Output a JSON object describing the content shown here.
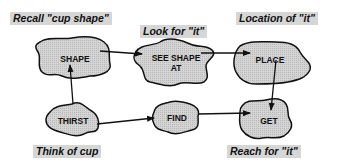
{
  "diagram": {
    "captions": {
      "recall": "Recall \"cup shape\"",
      "look": "Look for \"it\"",
      "location": "Location of \"it\"",
      "think": "Think of cup",
      "reach": "Reach for \"it\""
    },
    "nodes": {
      "shape": "SHAPE",
      "see_shape_line1": "SEE SHAPE",
      "see_shape_line2": "AT",
      "place": "PLACE",
      "thirst": "THIRST",
      "find": "FIND",
      "get": "GET"
    },
    "edges": [
      {
        "from": "THIRST",
        "to": "SHAPE"
      },
      {
        "from": "SHAPE",
        "to": "SEE SHAPE AT"
      },
      {
        "from": "SEE SHAPE AT",
        "to": "PLACE"
      },
      {
        "from": "PLACE",
        "to": "GET"
      },
      {
        "from": "THIRST",
        "to": "FIND"
      },
      {
        "from": "FIND",
        "to": "GET"
      }
    ],
    "colors": {
      "blob_fill": "#cfcfcf",
      "stroke": "#111111",
      "caption_bg": "#d6d6d6"
    }
  }
}
